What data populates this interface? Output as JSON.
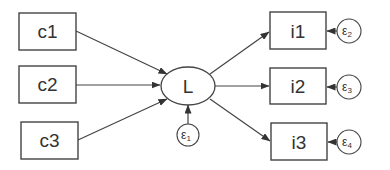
{
  "diagram": {
    "type": "structural-equation-model",
    "latent": {
      "id": "L",
      "label": "L"
    },
    "causes": [
      {
        "id": "c1",
        "label": "c1"
      },
      {
        "id": "c2",
        "label": "c2"
      },
      {
        "id": "c3",
        "label": "c3"
      }
    ],
    "indicators": [
      {
        "id": "i1",
        "label": "i1"
      },
      {
        "id": "i2",
        "label": "i2"
      },
      {
        "id": "i3",
        "label": "i3"
      }
    ],
    "errors": [
      {
        "id": "e1",
        "symbol": "ε",
        "sub": "1",
        "target": "L"
      },
      {
        "id": "e2",
        "symbol": "ε",
        "sub": "2",
        "target": "i1"
      },
      {
        "id": "e3",
        "symbol": "ε",
        "sub": "3",
        "target": "i2"
      },
      {
        "id": "e4",
        "symbol": "ε",
        "sub": "4",
        "target": "i3"
      }
    ],
    "edges": [
      {
        "from": "c1",
        "to": "L"
      },
      {
        "from": "c2",
        "to": "L"
      },
      {
        "from": "c3",
        "to": "L"
      },
      {
        "from": "L",
        "to": "i1"
      },
      {
        "from": "L",
        "to": "i2"
      },
      {
        "from": "L",
        "to": "i3"
      },
      {
        "from": "e1",
        "to": "L"
      },
      {
        "from": "e2",
        "to": "i1"
      },
      {
        "from": "e3",
        "to": "i2"
      },
      {
        "from": "e4",
        "to": "i3"
      }
    ]
  }
}
